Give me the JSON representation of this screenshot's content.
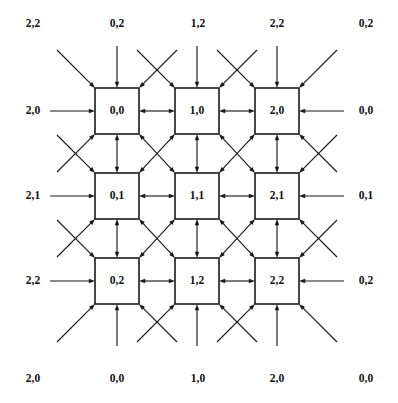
{
  "figure": {
    "type": "lattice-diagram",
    "title": ""
  },
  "geometry": {
    "cols": 3,
    "rows": 3,
    "origin_x": 95,
    "origin_y": 88,
    "pitch_x": 80,
    "pitch_y": 85,
    "box_width": 44,
    "box_height": 46,
    "outer_stub": 38
  },
  "grid": {
    "cells": [
      [
        {
          "label": "0,0"
        },
        {
          "label": "1,0"
        },
        {
          "label": "2,0"
        }
      ],
      [
        {
          "label": "0,1"
        },
        {
          "label": "1,1"
        },
        {
          "label": "2,1"
        }
      ],
      [
        {
          "label": "0,2"
        },
        {
          "label": "1,2"
        },
        {
          "label": "2,2"
        }
      ]
    ]
  },
  "borders": {
    "top": [
      {
        "label": "2,2",
        "x": 33,
        "y": 24
      },
      {
        "label": "0,2",
        "x": 117,
        "y": 24
      },
      {
        "label": "1,2",
        "x": 198,
        "y": 24
      },
      {
        "label": "2,2",
        "x": 277,
        "y": 24
      },
      {
        "label": "0,2",
        "x": 366,
        "y": 24
      }
    ],
    "bottom": [
      {
        "label": "2,0",
        "x": 33,
        "y": 379
      },
      {
        "label": "0,0",
        "x": 117,
        "y": 379
      },
      {
        "label": "1,0",
        "x": 198,
        "y": 379
      },
      {
        "label": "2,0",
        "x": 277,
        "y": 379
      },
      {
        "label": "0,0",
        "x": 366,
        "y": 379
      }
    ],
    "left": [
      {
        "label": "2,0",
        "x": 33,
        "y": 111
      },
      {
        "label": "2,1",
        "x": 33,
        "y": 196
      },
      {
        "label": "2,2",
        "x": 33,
        "y": 281
      }
    ],
    "right": [
      {
        "label": "0,0",
        "x": 366,
        "y": 111
      },
      {
        "label": "0,1",
        "x": 366,
        "y": 196
      },
      {
        "label": "0,2",
        "x": 366,
        "y": 281
      }
    ]
  },
  "colors": {
    "ink": "#1a1a1a",
    "text": "#111111",
    "background": "#ffffff"
  }
}
